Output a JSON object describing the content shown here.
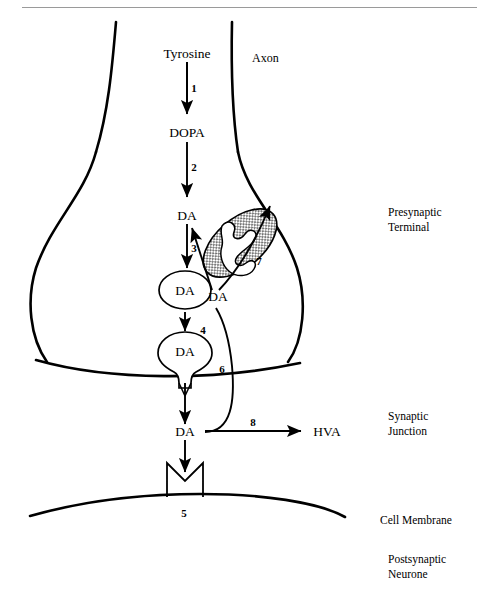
{
  "figure": {
    "background_color": "#ffffff",
    "ink_color": "#000000",
    "rule_color": "#9a9a9a",
    "width": 479,
    "height": 591
  },
  "region_labels": [
    {
      "key": "presynaptic",
      "line1": "Presynaptic",
      "line2": "Terminal",
      "x": 388,
      "y": 216
    },
    {
      "key": "synaptic",
      "line1": "Synaptic",
      "line2": "Junction",
      "x": 388,
      "y": 420
    },
    {
      "key": "cell_membrane",
      "line1": "Cell Membrane",
      "line2": "",
      "x": 380,
      "y": 520
    },
    {
      "key": "postsynaptic",
      "line1": "Postsynaptic",
      "line2": "Neurone",
      "x": 388,
      "y": 560
    }
  ],
  "axon_label": {
    "text": "Axon",
    "x": 252,
    "y": 62
  },
  "molecules": [
    {
      "key": "tyrosine",
      "text": "Tyrosine",
      "x": 187,
      "y": 53
    },
    {
      "key": "dopa",
      "text": "DOPA",
      "x": 187,
      "y": 132
    },
    {
      "key": "da_cytosol",
      "text": "DA",
      "x": 187,
      "y": 215
    },
    {
      "key": "da_vesicle_1",
      "text": "DA",
      "x": 185,
      "y": 291
    },
    {
      "key": "da_vesicle_2",
      "text": "DA",
      "x": 185,
      "y": 352
    },
    {
      "key": "da_reuptake",
      "text": "DA",
      "x": 216,
      "y": 299
    },
    {
      "key": "da_synaptic",
      "text": "DA",
      "x": 185,
      "y": 431
    },
    {
      "key": "hva",
      "text": "HVA",
      "x": 327,
      "y": 430
    }
  ],
  "steps": [
    {
      "number": "1",
      "x": 194,
      "y": 88,
      "description": "Tyrosine to DOPA (tyrosine hydroxylase)"
    },
    {
      "number": "2",
      "x": 194,
      "y": 167,
      "description": "DOPA to DA (DOPA decarboxylase)"
    },
    {
      "number": "3",
      "x": 194,
      "y": 248,
      "description": "DA packaged into storage vesicle"
    },
    {
      "number": "4",
      "x": 203,
      "y": 330,
      "description": "Vesicle migration and exocytosis"
    },
    {
      "number": "5",
      "x": 184,
      "y": 513,
      "description": "Postsynaptic receptor binding"
    },
    {
      "number": "6",
      "x": 222,
      "y": 369,
      "description": "Reuptake of DA into terminal"
    },
    {
      "number": "7",
      "x": 259,
      "y": 261,
      "description": "Metabolism by mitochondrial MAO"
    },
    {
      "number": "8",
      "x": 253,
      "y": 422,
      "description": "Degradation of DA to HVA"
    }
  ],
  "structures": [
    {
      "key": "axon",
      "label": "Axon"
    },
    {
      "key": "presynaptic-terminal",
      "label": "Presynaptic Terminal"
    },
    {
      "key": "mitochondrion",
      "label": "Mitochondrion"
    },
    {
      "key": "storage-vesicle-upper",
      "label": "Storage vesicle"
    },
    {
      "key": "storage-vesicle-lower",
      "label": "Storage vesicle"
    },
    {
      "key": "synaptic-cleft",
      "label": "Synaptic Junction"
    },
    {
      "key": "postsynaptic-receptor",
      "label": "Receptor"
    },
    {
      "key": "postsynaptic-membrane",
      "label": "Cell Membrane"
    }
  ]
}
